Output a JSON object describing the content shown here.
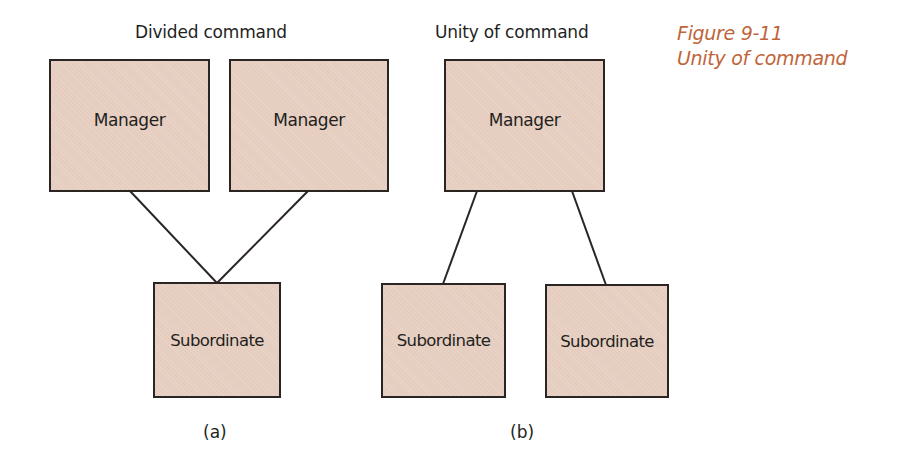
{
  "figure": {
    "number": "Figure 9-11",
    "title": "Unity of command",
    "caption_color": "#c0643a",
    "box_fill": "#e9d1c3"
  },
  "panels": [
    {
      "id": "a",
      "heading": "Divided command",
      "label": "(a)",
      "managers": [
        "Manager",
        "Manager"
      ],
      "subordinates": [
        "Subordinate"
      ]
    },
    {
      "id": "b",
      "heading": "Unity of command",
      "label": "(b)",
      "managers": [
        "Manager"
      ],
      "subordinates": [
        "Subordinate",
        "Subordinate"
      ]
    }
  ]
}
